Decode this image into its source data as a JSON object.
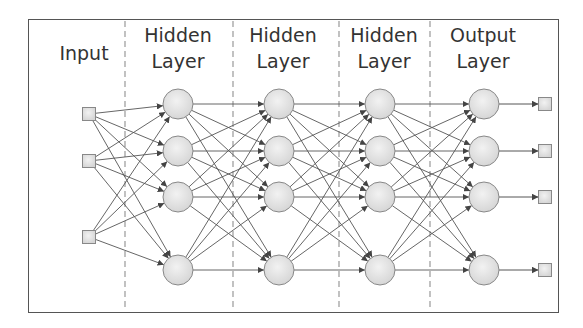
{
  "diagram": {
    "layers": [
      {
        "id": "input",
        "label_line1": "Input",
        "label_line2": "",
        "x": 89,
        "nodes_y": [
          114,
          161,
          237
        ],
        "shape": "square"
      },
      {
        "id": "hidden1",
        "label_line1": "Hidden",
        "label_line2": "Layer",
        "x": 178,
        "nodes_y": [
          104,
          151,
          197,
          270
        ],
        "shape": "circle"
      },
      {
        "id": "hidden2",
        "label_line1": "Hidden",
        "label_line2": "Layer",
        "x": 279,
        "nodes_y": [
          104,
          151,
          197,
          270
        ],
        "shape": "circle"
      },
      {
        "id": "hidden3",
        "label_line1": "Hidden",
        "label_line2": "Layer",
        "x": 380,
        "nodes_y": [
          104,
          151,
          197,
          270
        ],
        "shape": "circle"
      },
      {
        "id": "output",
        "label_line1": "Output",
        "label_line2": "Layer",
        "x": 484,
        "nodes_y": [
          104,
          151,
          197,
          270
        ],
        "shape": "circle"
      }
    ],
    "outputs": {
      "x": 545,
      "nodes_y": [
        104,
        151,
        197,
        270
      ],
      "shape": "square"
    },
    "dividers_x": [
      125,
      233,
      339,
      430
    ],
    "colors": {
      "node_fill": "#e4e4e4",
      "node_stroke": "#888888",
      "edge": "#555555",
      "divider": "#999999",
      "frame": "#555555",
      "text": "#333333"
    }
  }
}
